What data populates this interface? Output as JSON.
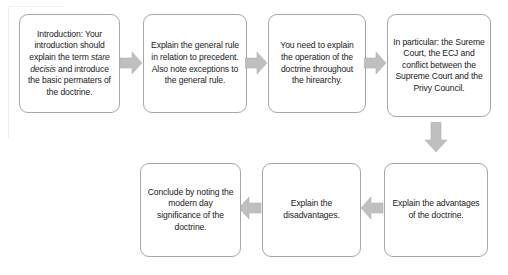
{
  "diagram": {
    "accent_color": "#bfbfbf",
    "box_border_color": "#a6a6a6",
    "text_color": "#1a1a1a",
    "background_color": "#ffffff",
    "nodes": [
      {
        "id": "node-1",
        "name": "introduction-box",
        "row": "top",
        "order": 1,
        "text": "Introduction: Your introduction should explain the term stare decisis and introduce the basic permaters of the doctrine.",
        "text_before_italic": "Introduction: Your introduction should explain the term ",
        "italic_text": "stare decisis",
        "text_after_italic": " and introduce the basic permaters of the doctrine."
      },
      {
        "id": "node-2",
        "name": "general-rule-box",
        "row": "top",
        "order": 2,
        "text": "Explain the general rule in relation to precedent. Also note exceptions to the general rule."
      },
      {
        "id": "node-3",
        "name": "operation-of-doctrine-box",
        "row": "top",
        "order": 3,
        "text": "You need to explain the operation of the doctrine throughout the hirearchy."
      },
      {
        "id": "node-4",
        "name": "courts-conflict-box",
        "row": "top",
        "order": 4,
        "text": "In particular: the Sureme Court, the ECJ and conflict between the Supreme Court and the Privy Council."
      },
      {
        "id": "node-5",
        "name": "advantages-box",
        "row": "bottom",
        "order": 5,
        "text": "Explain the advantages of the doctrine."
      },
      {
        "id": "node-6",
        "name": "disadvantages-box",
        "row": "bottom",
        "order": 6,
        "text": "Explain the disadvantages."
      },
      {
        "id": "node-7",
        "name": "conclusion-box",
        "row": "bottom",
        "order": 7,
        "text": "Conclude by noting the modern day significance of the doctrine."
      }
    ],
    "arrows": [
      {
        "id": "arrow-1",
        "name": "arrow-right-icon",
        "direction": "right",
        "from": "node-1",
        "to": "node-2"
      },
      {
        "id": "arrow-2",
        "name": "arrow-right-icon",
        "direction": "right",
        "from": "node-2",
        "to": "node-3"
      },
      {
        "id": "arrow-3",
        "name": "arrow-right-icon",
        "direction": "right",
        "from": "node-3",
        "to": "node-4"
      },
      {
        "id": "arrow-4",
        "name": "arrow-down-icon",
        "direction": "down",
        "from": "node-4",
        "to": "node-5"
      },
      {
        "id": "arrow-5",
        "name": "arrow-left-icon",
        "direction": "left",
        "from": "node-5",
        "to": "node-6"
      },
      {
        "id": "arrow-6",
        "name": "arrow-left-icon",
        "direction": "left",
        "from": "node-6",
        "to": "node-7"
      }
    ]
  }
}
